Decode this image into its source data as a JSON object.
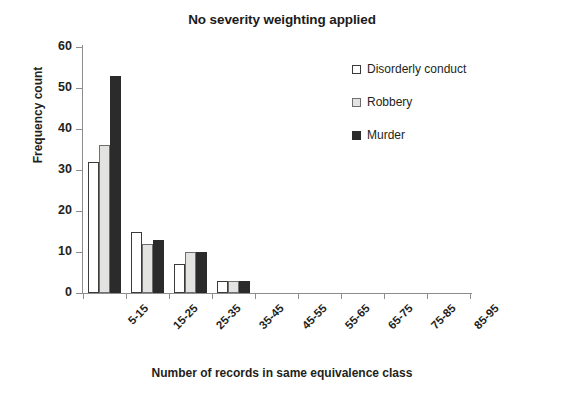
{
  "chart_data": {
    "type": "bar",
    "title": "No severity weighting applied",
    "xlabel": "Number of records in same equivalence class",
    "ylabel": "Frequency count",
    "categories": [
      "5-15",
      "15-25",
      "25-35",
      "35-45",
      "45-55",
      "55-65",
      "65-75",
      "75-85",
      "85-95"
    ],
    "series": [
      {
        "name": "Disorderly conduct",
        "color": "#ffffff",
        "values": [
          32,
          15,
          7,
          3,
          0,
          0,
          0,
          0,
          0
        ]
      },
      {
        "name": "Robbery",
        "color": "#e3e3e1",
        "values": [
          36,
          12,
          10,
          3,
          0,
          0,
          0,
          0,
          0
        ]
      },
      {
        "name": "Murder",
        "color": "#2b2b2b",
        "values": [
          53,
          13,
          10,
          3,
          0,
          0,
          0,
          0,
          0
        ]
      }
    ],
    "ylim": [
      0,
      60
    ],
    "ytick_step": 10,
    "yticks": [
      0,
      10,
      20,
      30,
      40,
      50,
      60
    ],
    "grid": false,
    "legend_position": "upper-right",
    "xtick_rotation": -45
  },
  "legend": {
    "items": [
      {
        "label": "Disorderly conduct",
        "swatch": "square-open-icon"
      },
      {
        "label": "Robbery",
        "swatch": "square-gray-icon"
      },
      {
        "label": "Murder",
        "swatch": "square-filled-icon"
      }
    ]
  }
}
